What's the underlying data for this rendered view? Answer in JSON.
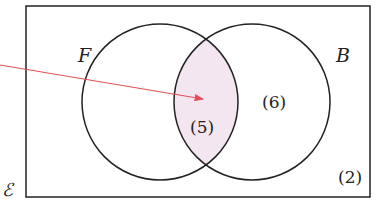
{
  "diagram": {
    "type": "venn",
    "universal_set_label": "ℰ",
    "sets": [
      {
        "name": "F",
        "label": "F"
      },
      {
        "name": "B",
        "label": "B"
      }
    ],
    "regions": {
      "intersection": "(5)",
      "b_only": "(6)",
      "outside": "(2)"
    },
    "highlight_color": "#f3e6f1",
    "arrow_color": "#e0505a",
    "line_color": "#222222"
  }
}
